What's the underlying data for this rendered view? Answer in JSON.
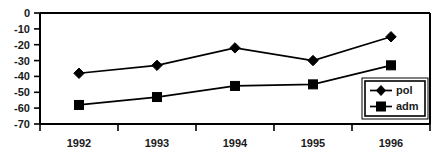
{
  "chart_data": {
    "type": "line",
    "title": "",
    "xlabel": "",
    "ylabel": "",
    "categories": [
      "1992",
      "1993",
      "1994",
      "1995",
      "1996"
    ],
    "series": [
      {
        "name": "pol",
        "marker": "diamond",
        "values": [
          -38,
          -33,
          -22,
          -30,
          -15
        ]
      },
      {
        "name": "adm",
        "marker": "square",
        "values": [
          -58,
          -53,
          -46,
          -45,
          -33
        ]
      }
    ],
    "ylim": [
      -70,
      0
    ],
    "yticks": [
      0,
      -10,
      -20,
      -30,
      -40,
      -50,
      -60,
      -70
    ],
    "ytick_labels": [
      "0",
      "-10",
      "-20",
      "-30",
      "-40",
      "-50",
      "-60",
      "-70"
    ],
    "grid": false,
    "legend_position": "bottom-right",
    "legend_entries": [
      "pol",
      "adm"
    ],
    "colors": {
      "series": "#000000",
      "axis": "#000000",
      "background": "#ffffff"
    }
  }
}
